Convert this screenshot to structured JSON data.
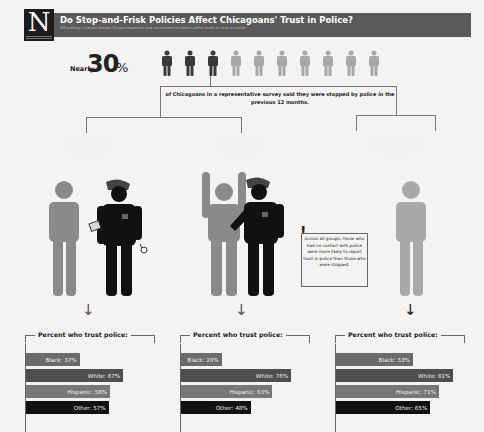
{
  "header": {
    "logo_letter": "N",
    "title": "Do Stop-and-Frisk Policies Affect Chicagoans' Trust in Police?",
    "subtitle": "IPR political scientist Wesley Skogan examines how unforeseen incidents affect levels of trust in police"
  },
  "stat": {
    "prefix": "Nearly",
    "value": "30",
    "unit": "%",
    "figures_total": 10,
    "figures_highlighted": 3,
    "description": "of Chicagoans in a representative survey said they were stopped by police in the previous 12 months."
  },
  "groups": [
    {
      "label": "Stopped for a violation",
      "color": "#747474"
    },
    {
      "label": "Stopped and frisked",
      "color": "#555555"
    },
    {
      "label": "No contact with police",
      "color": "#1b1b1b"
    }
  ],
  "note": {
    "icon": "exclamation-icon",
    "text": "Across all groups, those who had no contact with police were more likely to report trust in police than those who were stopped."
  },
  "panel_title": "Percent who trust police:",
  "colors": {
    "black_bar": "#6b6b6b",
    "white_bar": "#4e4e4e",
    "hispanic_bar": "#777777",
    "other_bar": "#111111",
    "figure_dark": "#3a3a3a",
    "figure_light": "#a8a8a8"
  },
  "chart_data": [
    {
      "type": "bar",
      "title": "Stopped for a violation — Percent who trust police",
      "categories": [
        "Black",
        "White",
        "Hispanic",
        "Other"
      ],
      "values": [
        37,
        67,
        58,
        57
      ],
      "labels": [
        "Black: 37%",
        "White: 67%",
        "Hispanic: 58%",
        "Other: 57%"
      ],
      "orientation": "horizontal",
      "xlim": [
        0,
        100
      ],
      "grid": false
    },
    {
      "type": "bar",
      "title": "Stopped and frisked — Percent who trust police",
      "categories": [
        "Black",
        "White",
        "Hispanic",
        "Other"
      ],
      "values": [
        28,
        76,
        63,
        48
      ],
      "labels": [
        "Black: 28%",
        "White: 76%",
        "Hispanic: 63%",
        "Other: 48%"
      ],
      "orientation": "horizontal",
      "xlim": [
        0,
        100
      ],
      "grid": false
    },
    {
      "type": "bar",
      "title": "No contact with police — Percent who trust police",
      "categories": [
        "Black",
        "White",
        "Hispanic",
        "Other"
      ],
      "values": [
        53,
        81,
        71,
        65
      ],
      "labels": [
        "Black: 53%",
        "White: 81%",
        "Hispanic: 71%",
        "Other: 65%"
      ],
      "orientation": "horizontal",
      "xlim": [
        0,
        100
      ],
      "grid": false
    }
  ]
}
